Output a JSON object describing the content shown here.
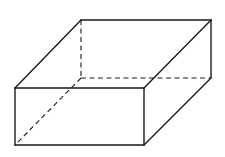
{
  "figure": {
    "type": "rectangular-prism",
    "background": "#ffffff",
    "stroke_color": "#1a1a1a",
    "vertices": {
      "front_top_left": [
        15,
        88
      ],
      "front_top_right": [
        144,
        88
      ],
      "front_bottom_left": [
        15,
        145
      ],
      "front_bottom_right": [
        144,
        145
      ],
      "back_top_left": [
        81,
        20
      ],
      "back_top_right": [
        211,
        20
      ],
      "back_bottom_left": [
        81,
        78
      ],
      "back_bottom_right": [
        211,
        78
      ]
    },
    "visible_edges": [
      [
        "front_top_left",
        "front_top_right"
      ],
      [
        "front_top_right",
        "front_bottom_right"
      ],
      [
        "front_bottom_right",
        "front_bottom_left"
      ],
      [
        "front_bottom_left",
        "front_top_left"
      ],
      [
        "front_top_left",
        "back_top_left"
      ],
      [
        "back_top_left",
        "back_top_right"
      ],
      [
        "back_top_right",
        "front_top_right"
      ],
      [
        "back_top_right",
        "back_bottom_right"
      ],
      [
        "back_bottom_right",
        "front_bottom_right"
      ]
    ],
    "hidden_edges": [
      [
        "back_top_left",
        "back_bottom_left"
      ],
      [
        "back_bottom_left",
        "back_bottom_right"
      ],
      [
        "back_bottom_left",
        "front_bottom_left"
      ]
    ]
  }
}
